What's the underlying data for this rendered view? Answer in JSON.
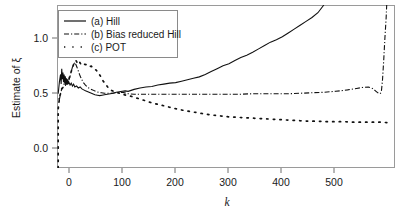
{
  "figure": {
    "background_color": "#ffffff",
    "frame_color": "#9a9a9a",
    "ink_color": "#111111"
  },
  "axes": {
    "y_title": "Estimate of ξ",
    "x_title": "k",
    "y_ticks": [
      "0.0",
      "0.5",
      "1.0"
    ],
    "x_ticks": [
      "0",
      "100",
      "200",
      "300",
      "400",
      "500"
    ]
  },
  "legend": {
    "entries": [
      {
        "key": "a",
        "label": "(a) Hill",
        "style": "solid"
      },
      {
        "key": "b",
        "label": "(b) Bias reduced Hill",
        "style": "dashdot"
      },
      {
        "key": "c",
        "label": "(c) POT",
        "style": "dotted"
      }
    ]
  },
  "chart_data": {
    "type": "line",
    "title": "",
    "subtitle": "",
    "xlabel": "k",
    "ylabel": "Estimate of ξ",
    "xlim": [
      0,
      570
    ],
    "ylim": [
      -0.37,
      1.32
    ],
    "xticks": [
      0,
      100,
      200,
      300,
      400,
      500
    ],
    "yticks": [
      0.0,
      0.5,
      1.0
    ],
    "grid": false,
    "legend_position": "top-left",
    "series": [
      {
        "name": "(a) Hill",
        "style": "solid",
        "color": "#111111",
        "x": [
          2,
          4,
          6,
          7,
          8,
          9,
          10,
          11,
          12,
          13,
          14,
          15,
          16,
          17,
          18,
          19,
          20,
          22,
          24,
          26,
          28,
          30,
          33,
          36,
          39,
          42,
          45,
          48,
          52,
          56,
          60,
          64,
          68,
          72,
          76,
          80,
          85,
          90,
          95,
          100,
          105,
          110,
          115,
          120,
          125,
          130,
          140,
          150,
          160,
          170,
          180,
          190,
          200,
          210,
          220,
          230,
          240,
          250,
          260,
          270,
          280,
          290,
          300,
          310,
          320,
          330,
          340,
          350,
          360,
          370,
          380,
          390,
          400,
          410,
          420,
          430,
          440,
          450
        ],
        "y": [
          0.4,
          0.52,
          0.6,
          0.5,
          0.66,
          0.55,
          0.62,
          0.52,
          0.6,
          0.51,
          0.58,
          0.5,
          0.56,
          0.49,
          0.55,
          0.5,
          0.52,
          0.49,
          0.51,
          0.48,
          0.5,
          0.47,
          0.48,
          0.46,
          0.47,
          0.45,
          0.44,
          0.43,
          0.42,
          0.41,
          0.4,
          0.39,
          0.385,
          0.38,
          0.385,
          0.39,
          0.395,
          0.4,
          0.405,
          0.415,
          0.42,
          0.425,
          0.43,
          0.425,
          0.435,
          0.445,
          0.46,
          0.47,
          0.475,
          0.49,
          0.5,
          0.51,
          0.515,
          0.53,
          0.545,
          0.56,
          0.575,
          0.6,
          0.63,
          0.66,
          0.69,
          0.71,
          0.745,
          0.775,
          0.8,
          0.83,
          0.865,
          0.9,
          0.935,
          0.96,
          0.99,
          1.03,
          1.07,
          1.11,
          1.15,
          1.19,
          1.24,
          1.32
        ]
      },
      {
        "name": "(b) Bias reduced Hill",
        "style": "dashdot",
        "color": "#111111",
        "x": [
          2,
          4,
          6,
          8,
          10,
          12,
          14,
          16,
          18,
          20,
          22,
          24,
          26,
          28,
          30,
          32,
          34,
          36,
          38,
          40,
          44,
          48,
          52,
          56,
          60,
          65,
          70,
          75,
          80,
          90,
          100,
          110,
          120,
          130,
          140,
          150,
          170,
          190,
          210,
          230,
          250,
          270,
          290,
          310,
          330,
          350,
          370,
          390,
          410,
          430,
          450,
          470,
          490,
          505,
          515,
          525,
          532,
          538,
          542,
          545,
          547,
          549,
          551,
          553,
          555,
          556
        ],
        "y": [
          0.35,
          0.34,
          0.4,
          0.45,
          0.46,
          0.5,
          0.48,
          0.52,
          0.5,
          0.54,
          0.58,
          0.63,
          0.675,
          0.7,
          0.725,
          0.7,
          0.67,
          0.635,
          0.6,
          0.57,
          0.52,
          0.49,
          0.465,
          0.45,
          0.44,
          0.425,
          0.415,
          0.41,
          0.405,
          0.405,
          0.41,
          0.415,
          0.4,
          0.395,
          0.395,
          0.395,
          0.395,
          0.395,
          0.395,
          0.395,
          0.395,
          0.395,
          0.395,
          0.395,
          0.4,
          0.4,
          0.4,
          0.4,
          0.405,
          0.41,
          0.415,
          0.425,
          0.44,
          0.455,
          0.465,
          0.47,
          0.455,
          0.425,
          0.405,
          0.4,
          0.42,
          0.55,
          0.75,
          0.98,
          1.18,
          1.32
        ]
      },
      {
        "name": "(c) POT",
        "style": "dotted",
        "color": "#111111",
        "x": [
          2,
          2,
          2,
          2,
          2,
          2,
          2,
          2,
          2,
          2,
          2,
          3,
          5,
          8,
          11,
          14,
          17,
          20,
          23,
          26,
          29,
          32,
          35,
          38,
          41,
          44,
          47,
          50,
          54,
          58,
          62,
          66,
          70,
          74,
          78,
          82,
          86,
          90,
          95,
          100,
          108,
          116,
          124,
          132,
          140,
          150,
          160,
          170,
          180,
          190,
          200,
          215,
          230,
          245,
          260,
          275,
          290,
          305,
          320,
          335,
          350,
          365,
          380,
          395,
          410,
          425,
          440,
          455,
          470,
          485,
          500,
          515,
          530,
          545,
          558
        ],
        "y": [
          -0.37,
          -0.3,
          -0.24,
          -0.18,
          -0.12,
          -0.06,
          0.0,
          0.06,
          0.12,
          0.18,
          0.24,
          0.3,
          0.38,
          0.45,
          0.48,
          0.5,
          0.52,
          0.55,
          0.61,
          0.67,
          0.72,
          0.745,
          0.71,
          0.73,
          0.695,
          0.7,
          0.705,
          0.7,
          0.68,
          0.685,
          0.66,
          0.645,
          0.615,
          0.575,
          0.53,
          0.5,
          0.465,
          0.44,
          0.425,
          0.415,
          0.4,
          0.385,
          0.375,
          0.36,
          0.345,
          0.325,
          0.305,
          0.29,
          0.275,
          0.26,
          0.245,
          0.225,
          0.21,
          0.195,
          0.18,
          0.17,
          0.16,
          0.155,
          0.15,
          0.145,
          0.14,
          0.135,
          0.13,
          0.125,
          0.12,
          0.115,
          0.115,
          0.11,
          0.11,
          0.11,
          0.105,
          0.105,
          0.105,
          0.105,
          0.1
        ]
      }
    ]
  }
}
